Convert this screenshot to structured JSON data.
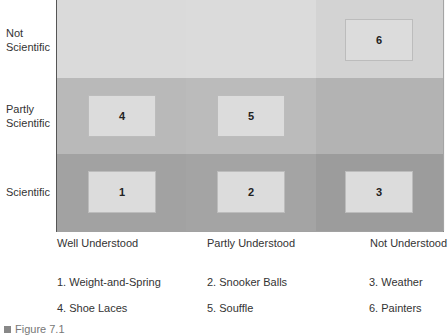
{
  "diagram": {
    "y_axis_labels": [
      {
        "line1": "Not",
        "line2": "Scientific"
      },
      {
        "line1": "Partly",
        "line2": "Scientific"
      },
      {
        "line1": "Scientific",
        "line2": ""
      }
    ],
    "x_axis_labels": [
      "Well Understood",
      "Partly Understood",
      "Not Understood"
    ],
    "boxes": [
      {
        "id": "1",
        "row": "Scientific",
        "col": "Well Understood"
      },
      {
        "id": "2",
        "row": "Scientific",
        "col": "Partly Understood"
      },
      {
        "id": "3",
        "row": "Scientific",
        "col": "Not Understood"
      },
      {
        "id": "4",
        "row": "Partly Scientific",
        "col": "Well Understood"
      },
      {
        "id": "5",
        "row": "Partly Scientific",
        "col": "Partly Understood"
      },
      {
        "id": "6",
        "row": "Not Scientific",
        "col": "Not Understood"
      }
    ],
    "legend": [
      "1. Weight-and-Spring",
      "2. Snooker Balls",
      "3. Weather",
      "4. Shoe Laces",
      "5. Souffle",
      "6. Painters"
    ],
    "caption": "Figure 7.1",
    "colors": {
      "band_top": "#dadada",
      "band_mid": "#b9b9b9",
      "band_bot": "#a2a2a2",
      "box": "#dcdcdc"
    }
  }
}
